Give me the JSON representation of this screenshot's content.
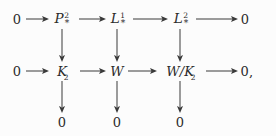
{
  "figure": {
    "kind": "commutative-diagram",
    "background_color": "#fcfcfc",
    "ink_color": "#2b2b2b",
    "arrow_color": "#3a3a3a"
  },
  "rows": [
    {
      "id": "row-top",
      "nodes": [
        {
          "id": "r1c0",
          "text": "0",
          "kind": "plain"
        },
        {
          "id": "r1c1",
          "text": "P",
          "superscript": "2",
          "subscript": "*",
          "kind": "script"
        },
        {
          "id": "r1c2",
          "text": "L",
          "superscript": "1",
          "subscript": "*",
          "kind": "script"
        },
        {
          "id": "r1c3",
          "text": "L",
          "superscript": "2",
          "subscript": "*",
          "kind": "script"
        },
        {
          "id": "r1c4",
          "text": "0",
          "kind": "plain"
        }
      ]
    },
    {
      "id": "row-middle",
      "nodes": [
        {
          "id": "r2c0",
          "text": "0",
          "kind": "plain"
        },
        {
          "id": "r2c1",
          "text": "K",
          "subscript": "2",
          "kind": "italic"
        },
        {
          "id": "r2c2",
          "text": "W",
          "kind": "italic"
        },
        {
          "id": "r2c3",
          "text": "W/K",
          "subscript": "2",
          "kind": "italic"
        },
        {
          "id": "r2c4",
          "text": "0,",
          "kind": "plain"
        }
      ]
    },
    {
      "id": "row-bottom",
      "nodes": [
        {
          "id": "r3c1",
          "text": "0",
          "kind": "plain"
        },
        {
          "id": "r3c2",
          "text": "0",
          "kind": "plain"
        },
        {
          "id": "r3c3",
          "text": "0",
          "kind": "plain"
        }
      ]
    }
  ],
  "sequences": {
    "top_row_reading": "0 -> P^2_* -> L^1_* -> L^2_* -> 0",
    "middle_row_reading": "0 -> K_2 -> W -> W/K_2 -> 0,",
    "bottom_row_reading": "0    0    0"
  },
  "arrows": {
    "horizontal_count": 8,
    "vertical_count": 6,
    "direction_horizontal": "left-to-right",
    "direction_vertical": "top-to-bottom"
  }
}
